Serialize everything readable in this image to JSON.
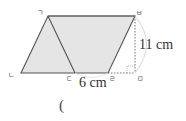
{
  "diagram": {
    "type": "geometry",
    "shape": "parallelogram",
    "fill_color": "#e5e5e5",
    "stroke_color": "#555555",
    "vertices": {
      "top_left": {
        "label": "ㄱ"
      },
      "bottom_left": {
        "label": "ㄴ"
      },
      "bottom_mid": {
        "label": "ㄷ"
      },
      "bottom_right": {
        "label": "ㄹ"
      },
      "height_foot": {
        "label": "ㅁ"
      },
      "top_right": {
        "label": "ㅂ"
      }
    },
    "measurements": {
      "base_segment": "6 cm",
      "height": "11 cm"
    },
    "answer_blank": "("
  }
}
